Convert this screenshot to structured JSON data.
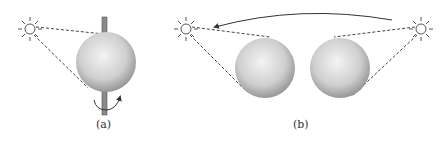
{
  "panels": [
    {
      "id": "a",
      "label": "(a)",
      "description": "Light source illuminating a rotating sphere on an axis"
    },
    {
      "id": "b",
      "label": "(b)",
      "description": "Light source moving around a fixed pair of spheres"
    }
  ],
  "colors": {
    "sphere_light": "#f4f4f4",
    "sphere_dark": "#8a8a8a",
    "line": "#444444",
    "axis": "#777777"
  }
}
